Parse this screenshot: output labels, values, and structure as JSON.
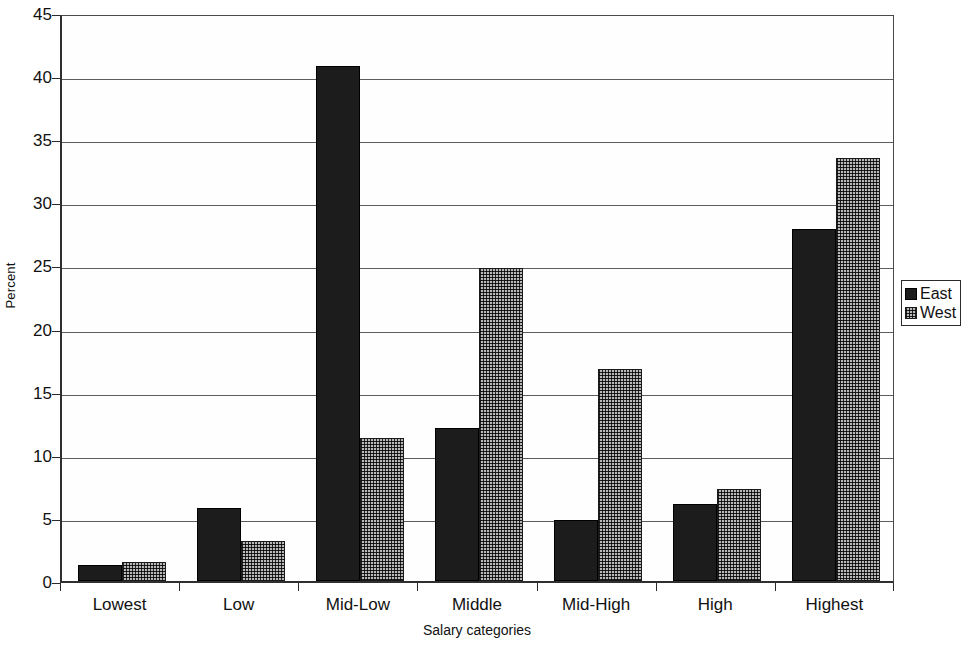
{
  "chart_data": {
    "type": "bar",
    "title": "",
    "subtitle": "",
    "xlabel": "Salary categories",
    "ylabel": "Percent",
    "categories": [
      "Lowest",
      "Low",
      "Mid-Low",
      "Middle",
      "Mid-High",
      "High",
      "Highest"
    ],
    "series": [
      {
        "name": "East",
        "values": [
          1.3,
          5.8,
          40.8,
          12.1,
          4.8,
          6.1,
          27.9
        ]
      },
      {
        "name": "West",
        "values": [
          1.5,
          3.2,
          11.3,
          24.8,
          16.8,
          7.3,
          33.5
        ]
      }
    ],
    "ylim": [
      0,
      45
    ],
    "yticks": [
      0,
      5,
      10,
      15,
      20,
      25,
      30,
      35,
      40,
      45
    ],
    "ytick_labels": [
      "0",
      "5",
      "10",
      "15",
      "20",
      "25",
      "30",
      "35",
      "40",
      "45"
    ],
    "grid": "horizontal",
    "legend_position": "right",
    "legend_entries": [
      {
        "label": "East",
        "swatch": "solid-black"
      },
      {
        "label": "West",
        "swatch": "dotted-gray"
      }
    ],
    "colors": {
      "east": "#1c1c1c",
      "west": "#b9b9b9",
      "axis": "#2f2f2f",
      "grid": "#5d5d5d",
      "background": "#ffffff"
    }
  }
}
